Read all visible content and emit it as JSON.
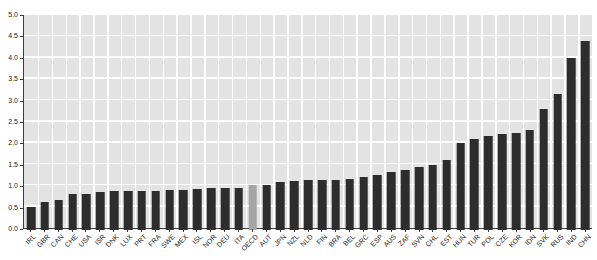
{
  "chart_data": {
    "type": "bar",
    "title": "",
    "xlabel": "",
    "ylabel": "",
    "categories": [
      "IRL",
      "GBR",
      "CAN",
      "CHE",
      "USA",
      "ISR",
      "DNK",
      "LUX",
      "PRT",
      "FRA",
      "SWE",
      "MEX",
      "ISL",
      "NOR",
      "DEU",
      "ITA",
      "OECD",
      "AUT",
      "JPN",
      "NZL",
      "NLD",
      "FIN",
      "BRA",
      "BEL",
      "GRC",
      "ESP",
      "AUS",
      "ZAF",
      "SVN",
      "CHL",
      "EST",
      "HUN",
      "TUR",
      "POL",
      "CZE",
      "KOR",
      "IDN",
      "SVK",
      "RUS",
      "IND",
      "CHN"
    ],
    "values": [
      0.5,
      0.6,
      0.65,
      0.8,
      0.8,
      0.84,
      0.86,
      0.86,
      0.88,
      0.88,
      0.89,
      0.9,
      0.91,
      0.93,
      0.93,
      0.95,
      1.0,
      1.02,
      1.07,
      1.1,
      1.12,
      1.12,
      1.13,
      1.16,
      1.2,
      1.25,
      1.32,
      1.37,
      1.43,
      1.47,
      1.6,
      2.0,
      2.08,
      2.15,
      2.2,
      2.22,
      2.3,
      2.8,
      3.15,
      4.0,
      4.4
    ],
    "highlight_category": "OECD",
    "ylim": [
      0,
      5
    ],
    "ytick_step": 0.5,
    "ytick_labels": [
      "0.0",
      "0.5",
      "1.0",
      "1.5",
      "2.0",
      "2.5",
      "3.0",
      "3.5",
      "4.0",
      "4.5",
      "5.0"
    ],
    "grid": true,
    "legend_position": "none",
    "colors": {
      "bar": "#2d2d2d",
      "highlight_bar": "#a5a5a5",
      "plot_background": "#e3e3e3",
      "gridline": "#ffffff",
      "axis": "#3c3c3c",
      "label": "#1a1a1a"
    }
  }
}
